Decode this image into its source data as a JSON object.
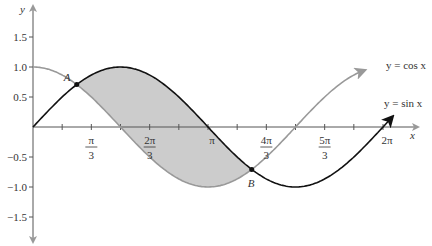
{
  "chart_data": {
    "type": "line",
    "title": "",
    "xlabel": "x",
    "ylabel": "y",
    "xlim": [
      0,
      6.6
    ],
    "ylim": [
      -1.8,
      1.8
    ],
    "grid": false,
    "series": [
      {
        "name": "y = sin x",
        "color": "#111111",
        "function": "sin",
        "x_range": [
          0,
          6.45
        ]
      },
      {
        "name": "y = cos x",
        "color": "#999999",
        "function": "cos",
        "x_range": [
          0,
          5.95
        ]
      }
    ],
    "shaded_region": {
      "between": [
        "sin x",
        "cos x"
      ],
      "from": "π/4",
      "to": "5π/4",
      "color": "#cccccc"
    },
    "points": [
      {
        "label": "A",
        "x": 0.7854,
        "y": 0.7071
      },
      {
        "label": "B",
        "x": 3.927,
        "y": -0.7071
      }
    ],
    "x_ticks": [
      {
        "label_num": "π",
        "label_den": "3",
        "value": 1.0472
      },
      {
        "label_num": "2π",
        "label_den": "3",
        "value": 2.0944
      },
      {
        "label_num": "π",
        "label_den": "",
        "value": 3.1416
      },
      {
        "label_num": "4π",
        "label_den": "3",
        "value": 4.1888
      },
      {
        "label_num": "5π",
        "label_den": "3",
        "value": 5.236
      },
      {
        "label_num": "2π",
        "label_den": "",
        "value": 6.2832
      }
    ],
    "y_ticks": [
      "1.5",
      "1.0",
      "0.5",
      "−0.5",
      "−1.0",
      "−1.5"
    ],
    "legend": {
      "cos_label": "y = cos x",
      "sin_label": "y = sin x"
    }
  }
}
